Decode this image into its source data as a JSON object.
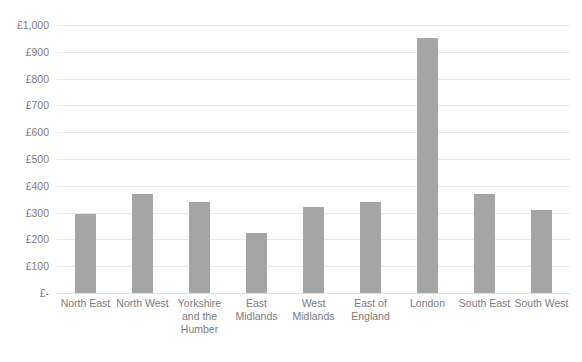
{
  "chart_data": {
    "type": "bar",
    "title": "",
    "xlabel": "",
    "ylabel": "",
    "categories": [
      "North East",
      "North West",
      "Yorkshire and the Humber",
      "East Midlands",
      "West Midlands",
      "East of England",
      "London",
      "South East",
      "South West"
    ],
    "values": [
      295,
      370,
      340,
      225,
      320,
      340,
      950,
      370,
      310
    ],
    "ylim": [
      0,
      1000
    ],
    "ytick_values": [
      1000,
      900,
      800,
      700,
      600,
      500,
      400,
      300,
      200,
      100,
      0
    ],
    "ytick_labels": [
      "£1,000",
      "£900",
      "£800",
      "£700",
      "£600",
      "£500",
      "£400",
      "£300",
      "£200",
      "£100",
      "£-"
    ],
    "grid": true,
    "legend": false,
    "currency_symbol": "£",
    "bar_color": "#a5a5a5",
    "gridline_color": "#e8e8e8",
    "text_color": "#7b7b7b",
    "background_color": "#ffffff"
  }
}
